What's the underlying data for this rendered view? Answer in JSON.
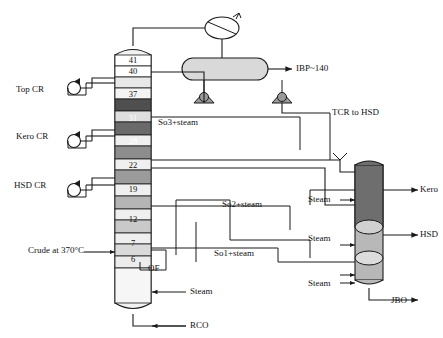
{
  "figure": {
    "type": "process-flow-diagram"
  },
  "main_column": {
    "name": "crude-distillation-column",
    "tray_numbers": [
      "41",
      "40",
      "37",
      "31",
      "28",
      "22",
      "19",
      "12",
      "7",
      "6"
    ]
  },
  "side_column": {
    "name": "side-stripper-column"
  },
  "labels": {
    "top_cr": "Top CR",
    "kero_cr": "Kero CR",
    "hsd_cr": "HSD CR",
    "crude_feed": "Crude at 370°C",
    "ibp_140": "IBP~140",
    "tcr_to_hsd": "TCR to HSD",
    "so3_steam": "So3+steam",
    "so2_steam": "So2+steam",
    "so1_steam": "So1+steam",
    "steam_kero": "Steam",
    "steam_hsd": "Steam",
    "steam_jbo": "Steam",
    "steam_bottom": "Steam",
    "kero": "Kero",
    "hsd": "HSD",
    "jbo": "JBO",
    "rco": "RCO",
    "of": "OF"
  },
  "colors": {
    "line": "#1a1a1a",
    "column_fill": "#f2f2f2",
    "tray_dark": "#5a5a5a",
    "tray_mid": "#9a9a9a",
    "tray_light": "#c9c9c9",
    "vessel_fill": "#d9d9d9",
    "side_col_top": "#6e6e6e",
    "side_col_bottom": "#b8b8b8"
  }
}
